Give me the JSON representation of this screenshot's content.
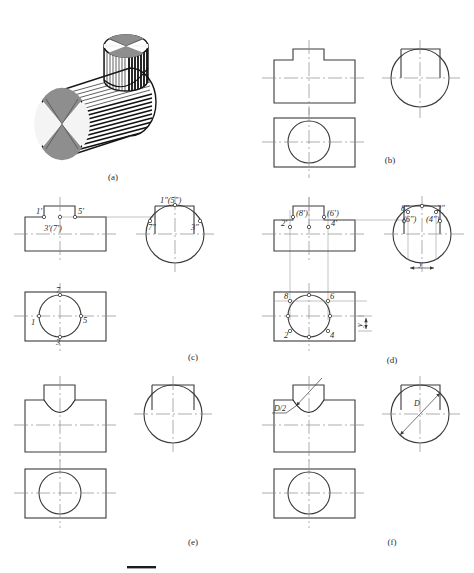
{
  "figure": {
    "colors": {
      "outline": "#3a3a3a",
      "outline_dark": "#2a2a2a",
      "centerline": "#8a8a8a",
      "projection": "#9a9a9a",
      "label": "#2b2b2b",
      "shading_dark": "#141414",
      "shading_mid": "#5a5a5a",
      "shading_light": "#d8d8d8",
      "background": "#ffffff"
    },
    "panels": [
      {
        "id": "a",
        "caption": "(a)",
        "kind": "pictorial",
        "description": "Isometric pictorial of a large horizontal cylinder with a smaller vertical cylinder intersecting it from above, rendered with line shading"
      },
      {
        "id": "b",
        "caption": "(b)",
        "kind": "orthographic",
        "description": "Three views: front view outline with notch, top view with circle, side view with circle. No intersection curve drawn yet.",
        "labels": []
      },
      {
        "id": "c",
        "caption": "(c)",
        "kind": "orthographic-points",
        "description": "Special points located on the three views",
        "labels": {
          "front": [
            "1'",
            "5'",
            "3'(7')"
          ],
          "side": [
            "1\"(5\")",
            "7\"",
            "3\""
          ],
          "top": [
            "7",
            "1",
            "5",
            "3"
          ]
        }
      },
      {
        "id": "d",
        "caption": "(d)",
        "kind": "orthographic-points",
        "description": "Intermediate points located using projection lines and the y transfer distance",
        "labels": {
          "front": [
            "(8')",
            "(6')",
            "2'",
            "4'"
          ],
          "side": [
            "8\"",
            "2\"",
            "(6\")",
            "(4\")"
          ],
          "top": [
            "8",
            "6",
            "2",
            "4"
          ]
        },
        "dimensions": [
          "y",
          "y"
        ]
      },
      {
        "id": "e",
        "caption": "(e)",
        "kind": "orthographic",
        "description": "Completed smooth intersection curve shown as a downward arc in the front view",
        "labels": []
      },
      {
        "id": "f",
        "caption": "(f)",
        "kind": "orthographic-dimensioned",
        "description": "Simplified approximate method using an arc of radius D/2 struck from the large cylinder diameter D",
        "labels": {
          "front": [
            "D/2"
          ],
          "side": [
            "D"
          ]
        }
      }
    ]
  }
}
